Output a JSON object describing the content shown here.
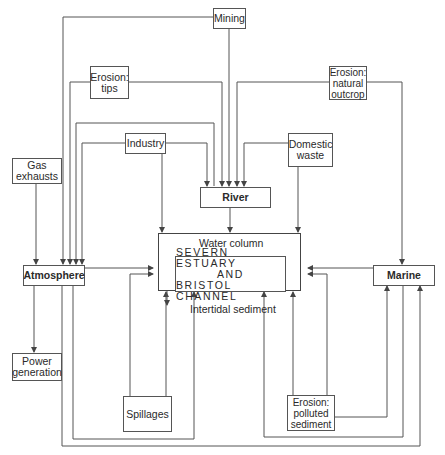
{
  "diagram": {
    "nodes": {
      "mining": {
        "label": "Mining"
      },
      "erosion_tips": {
        "line1": "Erosion:",
        "line2": "tips"
      },
      "erosion_outcrop": {
        "line1": "Erosion:",
        "line2": "natural",
        "line3": "outcrop"
      },
      "gas_exhausts": {
        "line1": "Gas",
        "line2": "exhausts"
      },
      "industry": {
        "label": "Industry"
      },
      "domestic_waste": {
        "line1": "Domestic",
        "line2": "waste"
      },
      "river": {
        "label": "River"
      },
      "atmosphere": {
        "label": "Atmosphere"
      },
      "marine": {
        "label": "Marine"
      },
      "power_generation": {
        "line1": "Power",
        "line2": "generation"
      },
      "spillages": {
        "label": "Spillages"
      },
      "erosion_polluted": {
        "line1": "Erosion:",
        "line2": "polluted",
        "line3": "sediment"
      },
      "estuary": {
        "top_label": "Water column",
        "bottom_label": "Intertidal sediment",
        "line1": "SEVERN ESTUARY",
        "line2": "AND",
        "line3": "BRISTOL CHANNEL"
      }
    },
    "edges": [
      {
        "from": "Mining",
        "to": "Atmosphere"
      },
      {
        "from": "Mining",
        "to": "River"
      },
      {
        "from": "Erosion: tips",
        "to": "Atmosphere"
      },
      {
        "from": "Erosion: tips",
        "to": "River"
      },
      {
        "from": "Erosion: natural outcrop",
        "to": "River"
      },
      {
        "from": "Erosion: natural outcrop",
        "to": "Marine"
      },
      {
        "from": "Industry",
        "to": "Atmosphere"
      },
      {
        "from": "Industry",
        "to": "River"
      },
      {
        "from": "Industry",
        "to": "Water column"
      },
      {
        "from": "Domestic waste",
        "to": "River"
      },
      {
        "from": "Domestic waste",
        "to": "Water column"
      },
      {
        "from": "Gas exhausts",
        "to": "Atmosphere"
      },
      {
        "from": "River",
        "to": "Water column"
      },
      {
        "from": "Atmosphere",
        "to": "Water column"
      },
      {
        "from": "Atmosphere",
        "to": "Power generation"
      },
      {
        "from": "Atmosphere",
        "to": "Intertidal sediment"
      },
      {
        "from": "Atmosphere",
        "to": "Marine"
      },
      {
        "from": "Marine",
        "to": "Water column"
      },
      {
        "from": "Marine",
        "to": "Intertidal sediment"
      },
      {
        "from": "Spillages",
        "to": "Water column"
      },
      {
        "from": "Spillages",
        "to": "Intertidal sediment"
      },
      {
        "from": "Erosion: polluted sediment",
        "to": "Water column"
      },
      {
        "from": "Erosion: polluted sediment",
        "to": "Intertidal sediment"
      },
      {
        "from": "Erosion: polluted sediment",
        "to": "Marine"
      },
      {
        "from": "Water column",
        "to": "Intertidal sediment"
      },
      {
        "from": "Intertidal sediment",
        "to": "Water column"
      }
    ],
    "colors": {
      "line": "#555555",
      "text": "#2a2a2a",
      "background": "#ffffff"
    }
  }
}
